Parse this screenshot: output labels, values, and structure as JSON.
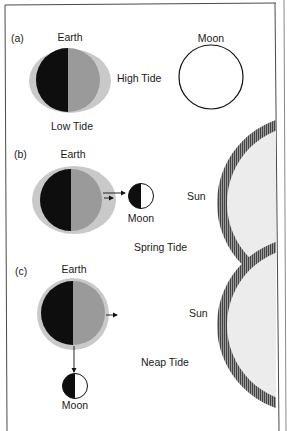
{
  "colors": {
    "earth_ocean_bulge": "#c9c9c9",
    "earth_day_side": "#9a9a9a",
    "earth_night_side": "#0e0e0e",
    "sun_fill": "#ececec",
    "sun_rays": "#555555",
    "frame": "#4a4a4a"
  },
  "panel_a": {
    "tag": "(a)",
    "earth_label": "Earth",
    "moon_label": "Moon",
    "high_tide_label": "High Tide",
    "low_tide_label": "Low Tide"
  },
  "panel_b": {
    "tag": "(b)",
    "earth_label": "Earth",
    "moon_label": "Moon",
    "sun_label": "Sun",
    "tide_label": "Spring Tide"
  },
  "panel_c": {
    "tag": "(c)",
    "earth_label": "Earth",
    "moon_label": "Moon",
    "sun_label": "Sun",
    "tide_label": "Neap Tide"
  }
}
